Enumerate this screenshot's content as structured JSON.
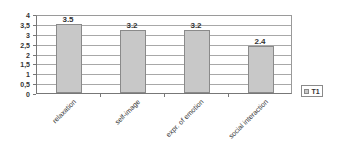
{
  "chart_data": {
    "type": "bar",
    "title": "",
    "xlabel": "",
    "ylabel": "",
    "categories": [
      "relaxation",
      "self-image",
      "expr. of emotion",
      "social interaction"
    ],
    "series": [
      {
        "name": "T1",
        "values": [
          3.5,
          3.2,
          3.2,
          2.4
        ],
        "color": "#c8c8c8"
      }
    ],
    "value_labels": [
      "3.5",
      "3.2",
      "3.2",
      "2.4"
    ],
    "ylim": [
      0,
      4
    ],
    "yticks": [
      "0",
      "0,5",
      "1",
      "1,5",
      "2",
      "2,5",
      "3",
      "3,5",
      "4"
    ],
    "grid": true,
    "legend_position": "right"
  },
  "legend": {
    "label": "T1"
  }
}
